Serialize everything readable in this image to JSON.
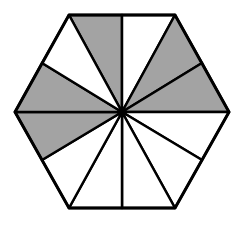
{
  "diagram": {
    "shape": "regular hexagon divided into 12 triangles from center to vertices and edge midpoints",
    "total_parts": 12,
    "shaded_parts": 5,
    "colors": {
      "fill_shaded": "#a3a3a3",
      "fill_unshaded": "#ffffff",
      "stroke": "#000000"
    },
    "center": [
      122,
      112
    ],
    "outline": [
      [
        69,
        15
      ],
      [
        175,
        15
      ],
      [
        229,
        112
      ],
      [
        175,
        208
      ],
      [
        69,
        208
      ],
      [
        15,
        112
      ]
    ],
    "triangles": [
      {
        "id": "t1",
        "a": [
          69,
          15
        ],
        "b": [
          122,
          15
        ],
        "shaded": true
      },
      {
        "id": "t2",
        "a": [
          122,
          15
        ],
        "b": [
          175,
          15
        ],
        "shaded": false
      },
      {
        "id": "t3",
        "a": [
          175,
          15
        ],
        "b": [
          202,
          63
        ],
        "shaded": true
      },
      {
        "id": "t4",
        "a": [
          202,
          63
        ],
        "b": [
          229,
          112
        ],
        "shaded": true
      },
      {
        "id": "t5",
        "a": [
          229,
          112
        ],
        "b": [
          202,
          160
        ],
        "shaded": false
      },
      {
        "id": "t6",
        "a": [
          202,
          160
        ],
        "b": [
          175,
          208
        ],
        "shaded": false
      },
      {
        "id": "t7",
        "a": [
          175,
          208
        ],
        "b": [
          122,
          208
        ],
        "shaded": false
      },
      {
        "id": "t8",
        "a": [
          122,
          208
        ],
        "b": [
          69,
          208
        ],
        "shaded": false
      },
      {
        "id": "t9",
        "a": [
          69,
          208
        ],
        "b": [
          42,
          160
        ],
        "shaded": false
      },
      {
        "id": "t10",
        "a": [
          42,
          160
        ],
        "b": [
          15,
          112
        ],
        "shaded": true
      },
      {
        "id": "t11",
        "a": [
          15,
          112
        ],
        "b": [
          42,
          63
        ],
        "shaded": true
      },
      {
        "id": "t12",
        "a": [
          42,
          63
        ],
        "b": [
          69,
          15
        ],
        "shaded": false
      }
    ]
  }
}
